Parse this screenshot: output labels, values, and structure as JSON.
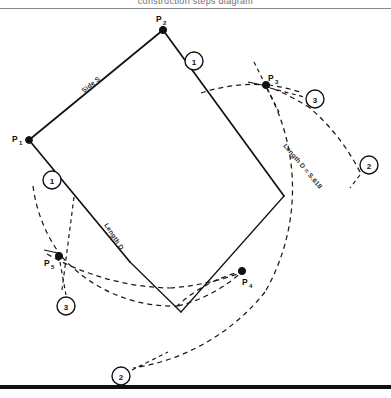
{
  "figure": {
    "caption_clipped": "construction steps diagram",
    "background_color": "#ffffff",
    "ink_color": "#111111"
  },
  "points": [
    {
      "id": "p1",
      "label": "P",
      "subscript": "1",
      "x": 29,
      "y": 140,
      "label_x": 12,
      "label_y": 139
    },
    {
      "id": "p2",
      "label": "P",
      "subscript": "2",
      "x": 163,
      "y": 30,
      "label_x": 158,
      "label_y": 20
    },
    {
      "id": "p3",
      "label": "P",
      "subscript": "3",
      "x": 266,
      "y": 85,
      "label_x": 267,
      "label_y": 80
    },
    {
      "id": "p4",
      "label": "P",
      "subscript": "4",
      "x": 242,
      "y": 271,
      "label_x": 243,
      "label_y": 283
    },
    {
      "id": "p5",
      "label": "P",
      "subscript": "5",
      "x": 59,
      "y": 256,
      "label_x": 44,
      "label_y": 264
    }
  ],
  "step_badges": [
    {
      "id": "badge-1-left",
      "number": "1",
      "x": 52,
      "y": 180
    },
    {
      "id": "badge-1-right",
      "number": "1",
      "x": 194,
      "y": 61
    },
    {
      "id": "badge-2-right",
      "number": "2",
      "x": 369,
      "y": 165
    },
    {
      "id": "badge-2-bottom",
      "number": "2",
      "x": 121,
      "y": 376
    },
    {
      "id": "badge-3-right",
      "number": "3",
      "x": 315,
      "y": 99
    },
    {
      "id": "badge-3-left",
      "number": "3",
      "x": 66,
      "y": 306
    }
  ],
  "annotations": [
    {
      "id": "side-s",
      "text": "Side S",
      "x": 84,
      "y": 93,
      "rotation": -39
    },
    {
      "id": "length-d-left",
      "text": "Length D",
      "x": 104,
      "y": 225,
      "rotation": 57
    },
    {
      "id": "length-d-right",
      "text": "Length D = S.618",
      "x": 315,
      "y": 155,
      "rotation": 50
    }
  ],
  "segments": [
    {
      "id": "side-s-segment",
      "from": "p1",
      "to": "p2",
      "style": "solid"
    },
    {
      "id": "p2-to-p4-ray",
      "from": "p2",
      "to": "p4-extension",
      "style": "solid"
    },
    {
      "id": "p1-to-lower-ray",
      "from": "p1",
      "to": "lower-extension",
      "style": "solid"
    }
  ],
  "arcs": [
    {
      "id": "arc-from-p2",
      "center": "p2",
      "label": "radius D arc through P3 and P4",
      "style": "dashed"
    },
    {
      "id": "arc-from-p1",
      "center": "p1",
      "label": "radius D arc through P5 and P4",
      "style": "dashed"
    }
  ],
  "legend": {
    "step_1": "Draw side S and construction rays",
    "step_2": "Swing arcs of length D",
    "step_3": "Mark intersection points"
  }
}
